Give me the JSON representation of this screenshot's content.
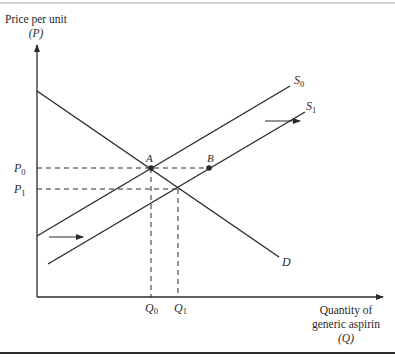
{
  "diagram": {
    "type": "supply-demand",
    "y_axis": {
      "label_line1": "Price per unit",
      "label_line2": "(P)"
    },
    "x_axis": {
      "label_line1": "Quantity of",
      "label_line2": "generic aspirin",
      "label_line3": "(Q)"
    },
    "curves": {
      "S0": {
        "name": "S",
        "sub": "0"
      },
      "S1": {
        "name": "S",
        "sub": "1"
      },
      "D": {
        "name": "D"
      }
    },
    "points": {
      "A": "A",
      "B": "B"
    },
    "price_ticks": {
      "P0": {
        "name": "P",
        "sub": "0"
      },
      "P1": {
        "name": "P",
        "sub": "1"
      }
    },
    "quantity_ticks": {
      "Q0": {
        "name": "Q",
        "sub": "0"
      },
      "Q1": {
        "name": "Q",
        "sub": "1"
      }
    },
    "colors": {
      "line": "#2a2a2a",
      "border": "#9a9a9a"
    }
  }
}
